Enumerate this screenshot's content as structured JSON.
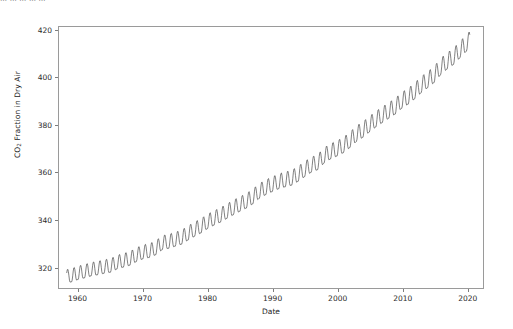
{
  "page": {
    "truncated_top_text": "… … … … …",
    "background_color": "#ffffff"
  },
  "chart_data": {
    "type": "line",
    "title": "",
    "xlabel": "Date",
    "ylabel": "CO2 Fraction in Dry Air",
    "ylabel_has_subscript": true,
    "xlim": [
      1957.0,
      2022.5
    ],
    "ylim": [
      311.0,
      421.5
    ],
    "xticks": [
      1960,
      1970,
      1980,
      1990,
      2000,
      2010,
      2020
    ],
    "xtick_labels": [
      "1960",
      "1970",
      "1980",
      "1990",
      "2000",
      "2010",
      "2020"
    ],
    "yticks": [
      320,
      340,
      360,
      380,
      400,
      420
    ],
    "ytick_labels": [
      "320",
      "340",
      "360",
      "380",
      "400",
      "420"
    ],
    "grid": false,
    "legend": null,
    "line_color": "#4a4a4a",
    "line_width": 0.7,
    "series": [
      {
        "name": "CO2 Fraction in Dry Air",
        "annual_mean_x": [
          1958,
          1959,
          1960,
          1961,
          1962,
          1963,
          1964,
          1965,
          1966,
          1967,
          1968,
          1969,
          1970,
          1971,
          1972,
          1973,
          1974,
          1975,
          1976,
          1977,
          1978,
          1979,
          1980,
          1981,
          1982,
          1983,
          1984,
          1985,
          1986,
          1987,
          1988,
          1989,
          1990,
          1991,
          1992,
          1993,
          1994,
          1995,
          1996,
          1997,
          1998,
          1999,
          2000,
          2001,
          2002,
          2003,
          2004,
          2005,
          2006,
          2007,
          2008,
          2009,
          2010,
          2011,
          2012,
          2013,
          2014,
          2015,
          2016,
          2017,
          2018,
          2019,
          2020
        ],
        "annual_mean_y": [
          315.3,
          315.9,
          316.9,
          317.6,
          318.4,
          318.9,
          319.5,
          320.0,
          321.4,
          322.2,
          323.0,
          324.6,
          325.7,
          326.3,
          327.5,
          329.7,
          330.2,
          331.1,
          332.0,
          333.8,
          335.4,
          336.8,
          338.7,
          340.1,
          341.4,
          343.0,
          344.6,
          346.0,
          347.4,
          349.2,
          351.6,
          353.1,
          354.4,
          355.6,
          356.4,
          357.1,
          358.8,
          360.8,
          362.6,
          363.7,
          366.6,
          368.3,
          369.5,
          371.0,
          373.2,
          375.8,
          377.5,
          379.8,
          381.9,
          383.8,
          385.6,
          387.4,
          389.9,
          391.6,
          393.9,
          396.5,
          398.6,
          400.8,
          404.2,
          406.5,
          408.5,
          411.4,
          414.2
        ],
        "seasonal_amplitude_ppm": 3.0,
        "seasonal_peak_month": 5,
        "data_start": 1958.2,
        "data_end": 2020.5,
        "first_value": 315.3,
        "last_value": 414.2,
        "max_value": 417.0,
        "min_value": 313.0
      }
    ]
  }
}
